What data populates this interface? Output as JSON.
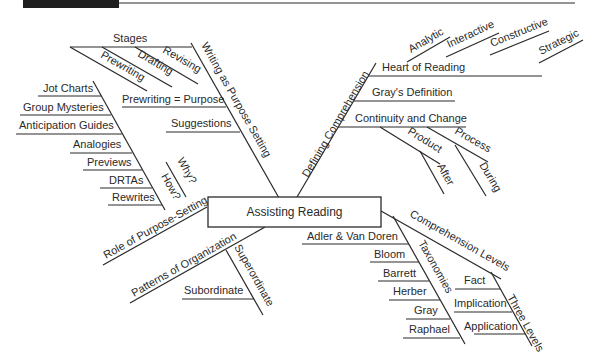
{
  "header_bar": {
    "color": "#1f1f1f"
  },
  "center": {
    "label": "Assisting Reading"
  },
  "branches": {
    "writing": {
      "label": "Writing as Purpose Setting",
      "stages": {
        "label": "Stages",
        "children": [
          "Prewriting",
          "Drafting",
          "Revising"
        ]
      },
      "prewriting_purpose": "Prewriting = Purpose",
      "suggestions": "Suggestions"
    },
    "role": {
      "label": "Role of Purpose-Setting",
      "how": {
        "label": "How?",
        "children": [
          "Jot Charts",
          "Group Mysteries",
          "Anticipation Guides",
          "Analogies",
          "Previews",
          "DRTAs",
          "Rewrites"
        ]
      },
      "why": "Why?"
    },
    "patterns": {
      "label": "Patterns of Organization",
      "superordinate": "Superordinate",
      "subordinate": "Subordinate"
    },
    "defining": {
      "label": "Defining Comprehension",
      "heart": {
        "label": "Heart of Reading",
        "children": [
          "Analytic",
          "Interactive",
          "Constructive",
          "Strategic"
        ]
      },
      "gray": "Gray's Definition",
      "continuity": {
        "label": "Continuity and Change",
        "product": {
          "label": "Product",
          "child": "After"
        },
        "process": {
          "label": "Process",
          "child": "During"
        }
      }
    },
    "levels": {
      "label": "Comprehension Levels",
      "taxonomies": {
        "label": "Taxonomies",
        "children": [
          "Adler & Van Doren",
          "Bloom",
          "Barrett",
          "Herber",
          "Gray",
          "Raphael"
        ]
      },
      "three": {
        "label": "Three Levels",
        "children": [
          "Fact",
          "Implication",
          "Application"
        ]
      }
    }
  }
}
